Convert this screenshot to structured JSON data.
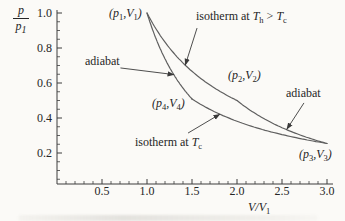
{
  "colors": {
    "background": "#fbfaf7",
    "axis": "#3c3c3c",
    "curve": "#5f5f5f",
    "arrow": "#3a3a3a",
    "text": "#262626"
  },
  "labels": {
    "y_axis": {
      "num": "p",
      "den": "p",
      "den_sub": "1"
    },
    "x_axis": {
      "base": "V",
      "slash": "/",
      "denom": "V",
      "sub": "1"
    },
    "p1": {
      "pre": "(p",
      "sub1": "1",
      "mid": ",V",
      "sub2": "1",
      "post": ")"
    },
    "p2": {
      "pre": "(p",
      "sub1": "2",
      "mid": ",V",
      "sub2": "2",
      "post": ")"
    },
    "p3": {
      "pre": "(p",
      "sub1": "3",
      "mid": ",V",
      "sub2": "3",
      "post": ")"
    },
    "p4": {
      "pre": "(p",
      "sub1": "4",
      "mid": ",V",
      "sub2": "4",
      "post": ")"
    },
    "isotherm_hot": {
      "pre": "isotherm at ",
      "t1": "T",
      "s1": "h",
      "mid": " > ",
      "t2": "T",
      "s2": "c"
    },
    "isotherm_cold": {
      "pre": "isotherm at ",
      "t": "T",
      "s": "c"
    },
    "adiabat_left": "adiabat",
    "adiabat_right": "adiabat"
  },
  "chart_data": {
    "type": "line",
    "xlabel": "V/V1",
    "ylabel": "p/p1",
    "xlim": [
      0,
      3.0
    ],
    "ylim": [
      0,
      1.0
    ],
    "grid": false,
    "legend": "none",
    "x_ticks": {
      "values": [
        0.5,
        1.0,
        1.5,
        2.0,
        2.5,
        3.0
      ],
      "labels": [
        "0.5",
        "1.0",
        "1.5",
        "2.0",
        "2.5",
        "3.0"
      ],
      "minor_step": 0.1
    },
    "y_ticks": {
      "values": [
        1.0,
        0.8,
        0.6,
        0.4,
        0.2
      ],
      "labels": [
        "1.0",
        "0.8",
        "0.6",
        "0.4",
        "0.2"
      ],
      "minor_step": 0.05
    },
    "gamma": 1.6667,
    "cycle_points": [
      {
        "name": "p1V1",
        "V": 1.0,
        "p": 1.0
      },
      {
        "name": "p2V2",
        "V": 2.0,
        "p": 0.5
      },
      {
        "name": "p3V3",
        "V": 3.0,
        "p": 0.254
      },
      {
        "name": "p4V4",
        "V": 1.5,
        "p": 0.509
      }
    ],
    "segments": [
      {
        "name": "isotherm-Th",
        "kind": "isotherm",
        "c": 1.0,
        "exp": 1.0,
        "v1": 1.0,
        "v2": 2.0
      },
      {
        "name": "adiabat-2-3",
        "kind": "adiabat",
        "c": 1.5874,
        "exp": 1.6667,
        "v1": 2.0,
        "v2": 3.0
      },
      {
        "name": "isotherm-Tc",
        "kind": "isotherm",
        "c": 0.7631,
        "exp": 1.0,
        "v1": 1.5,
        "v2": 3.0
      },
      {
        "name": "adiabat-4-1",
        "kind": "adiabat",
        "c": 1.0,
        "exp": 1.6667,
        "v1": 1.0,
        "v2": 1.5
      }
    ],
    "arrows": [
      {
        "name": "to-isotherm-hot",
        "from": [
          1.556,
          0.914
        ],
        "to": [
          1.425,
          0.702
        ]
      },
      {
        "name": "to-adiabat-left",
        "from": [
          0.705,
          0.686
        ],
        "to": [
          1.3,
          0.648
        ]
      },
      {
        "name": "to-isotherm-cold",
        "from": [
          1.456,
          0.314
        ],
        "to": [
          1.81,
          0.422
        ]
      },
      {
        "name": "to-adiabat-right",
        "from": [
          2.744,
          0.486
        ],
        "to": [
          2.553,
          0.335
        ]
      }
    ]
  }
}
